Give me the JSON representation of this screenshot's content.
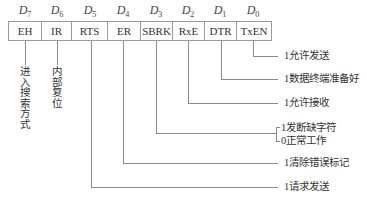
{
  "register": {
    "bits": [
      {
        "label": "D",
        "sub": "7",
        "name": "EH"
      },
      {
        "label": "D",
        "sub": "6",
        "name": "IR"
      },
      {
        "label": "D",
        "sub": "5",
        "name": "RTS"
      },
      {
        "label": "D",
        "sub": "4",
        "name": "ER"
      },
      {
        "label": "D",
        "sub": "3",
        "name": "SBRK"
      },
      {
        "label": "D",
        "sub": "2",
        "name": "RxE"
      },
      {
        "label": "D",
        "sub": "1",
        "name": "DTR"
      },
      {
        "label": "D",
        "sub": "0",
        "name": "TxEN"
      }
    ]
  },
  "annotations": {
    "eh": "进入搜索方式",
    "ir": "内部复位",
    "txen": "1允许发送",
    "dtr": "1数据终端准备好",
    "rxe": "1允许接收",
    "sbrk_1": "1发断缺字符",
    "sbrk_0": "0正常工作",
    "er": "1清除错误标记",
    "rts": "1请求发送"
  }
}
